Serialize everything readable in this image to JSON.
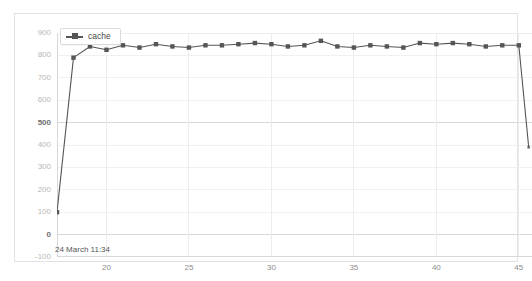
{
  "legend": {
    "entries": [
      {
        "label": "cache",
        "color": "#555555",
        "marker": "square"
      }
    ],
    "position": "top-left"
  },
  "footer": {
    "timestamp": "24 March 11:34"
  },
  "chart_data": {
    "type": "line",
    "title": "",
    "xlabel": "",
    "ylabel": "",
    "grid": true,
    "legend_position": "top-left",
    "xlim": [
      17.0,
      45.8
    ],
    "ylim": [
      -100,
      900
    ],
    "xticks": [
      20,
      25,
      30,
      35,
      40,
      45
    ],
    "yticks": [
      -100,
      0,
      100,
      200,
      300,
      400,
      500,
      600,
      700,
      800,
      900
    ],
    "ytick_labels": [
      "-100",
      "0",
      "100",
      "200",
      "300",
      "400",
      "500",
      "600",
      "700",
      "800",
      "900"
    ],
    "ymajor": [
      0,
      500
    ],
    "series": [
      {
        "name": "cache",
        "color": "#555555",
        "marker": "square",
        "x": [
          17,
          18,
          19,
          20,
          21,
          22,
          23,
          24,
          25,
          26,
          27,
          28,
          29,
          30,
          31,
          32,
          33,
          34,
          35,
          36,
          37,
          38,
          39,
          40,
          41,
          42,
          43,
          44,
          45,
          45.6
        ],
        "values": [
          100,
          790,
          840,
          825,
          845,
          835,
          850,
          840,
          835,
          845,
          845,
          850,
          855,
          850,
          840,
          845,
          865,
          840,
          835,
          845,
          840,
          835,
          855,
          850,
          855,
          850,
          840,
          845,
          845,
          390
        ]
      }
    ]
  }
}
